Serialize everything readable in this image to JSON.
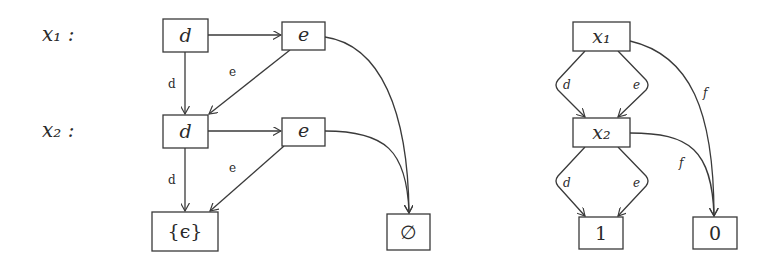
{
  "left_diagram": {
    "row_labels": [
      "x₁ :",
      "x₂ :"
    ],
    "nodes": {
      "d1": "d",
      "e1": "e",
      "d2": "d",
      "e2": "e",
      "eps": "{ϵ}",
      "empty": "∅"
    },
    "edge_labels": {
      "d1_d2": "d",
      "e1_d2": "e",
      "d2_eps": "d",
      "e2_eps": "e"
    }
  },
  "right_diagram": {
    "nodes": {
      "x1": "x₁",
      "x2": "x₂",
      "one": "1",
      "zero": "0"
    },
    "edge_labels": {
      "x1_x2_d": "d",
      "x1_x2_e": "e",
      "x1_zero_f": "f",
      "x2_one_d": "d",
      "x2_one_e": "e",
      "x2_zero_f": "f"
    }
  }
}
